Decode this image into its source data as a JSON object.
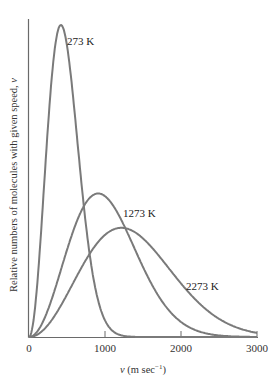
{
  "chart_data": {
    "type": "line",
    "title": "",
    "xlabel": "v (m sec⁻¹)",
    "xlabel_var": "v",
    "xlabel_unit": " (m sec",
    "xlabel_exp": "−1",
    "xlabel_close": ")",
    "ylabel": "Relative numbers of molecules with given speed, v",
    "ylabel_text": "Relative numbers of molecules with given speed, ",
    "ylabel_var": "v",
    "xlim": [
      0,
      3000
    ],
    "xticks": [
      0,
      1000,
      2000,
      3000
    ],
    "xtick_labels": [
      "0",
      "1000",
      "2000",
      "3000"
    ],
    "ylim": [
      0,
      1
    ],
    "grid": false,
    "legend": "inline labels",
    "series": [
      {
        "name": "273 K",
        "temperature_K": 273,
        "peak_speed": 420,
        "peak_relative_height": 1.0,
        "x": [
          0,
          100,
          200,
          300,
          420,
          500,
          600,
          700,
          800,
          1000,
          1200
        ],
        "y": [
          0.0,
          0.14,
          0.47,
          0.81,
          1.0,
          0.93,
          0.7,
          0.45,
          0.25,
          0.05,
          0.006
        ]
      },
      {
        "name": "1273 K",
        "temperature_K": 1273,
        "peak_speed": 910,
        "peak_relative_height": 0.46,
        "x": [
          0,
          200,
          400,
          600,
          800,
          910,
          1000,
          1200,
          1400,
          1600,
          2000,
          2400,
          2800
        ],
        "y": [
          0.0,
          0.06,
          0.2,
          0.34,
          0.44,
          0.46,
          0.45,
          0.39,
          0.29,
          0.19,
          0.06,
          0.012,
          0.002
        ]
      },
      {
        "name": "2273 K",
        "temperature_K": 2273,
        "peak_speed": 1215,
        "peak_relative_height": 0.35,
        "x": [
          0,
          200,
          400,
          600,
          800,
          1000,
          1215,
          1400,
          1600,
          2000,
          2400,
          2800,
          3000
        ],
        "y": [
          0.0,
          0.03,
          0.1,
          0.18,
          0.26,
          0.32,
          0.35,
          0.34,
          0.31,
          0.21,
          0.11,
          0.045,
          0.027
        ]
      }
    ],
    "labels": [
      {
        "text": "273 K",
        "x_px": 67,
        "y_px": 45
      },
      {
        "text": "1273 K",
        "x_px": 123,
        "y_px": 217
      },
      {
        "text": "2273 K",
        "x_px": 186,
        "y_px": 290
      }
    ]
  },
  "layout": {
    "origin_x": 29,
    "origin_y": 337,
    "px_per_1000": 76,
    "top_y": 19,
    "peak_px_height": 312
  }
}
